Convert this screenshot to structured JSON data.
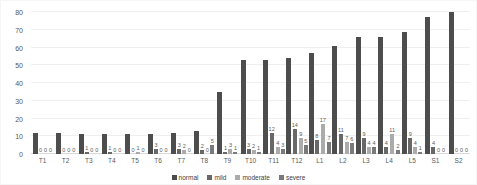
{
  "chart_data": {
    "type": "bar",
    "title": "",
    "xlabel": "",
    "ylabel": "",
    "ylim": [
      0,
      80
    ],
    "yticks": [
      0,
      10,
      20,
      30,
      40,
      50,
      60,
      70,
      80
    ],
    "grid": true,
    "legend_position": "bottom",
    "categories": [
      "T1",
      "T2",
      "T3",
      "T4",
      "T5",
      "T6",
      "T7",
      "T8",
      "T9",
      "T10",
      "T11",
      "T12",
      "L1",
      "L2",
      "L3",
      "L4",
      "L5",
      "S1",
      "S2"
    ],
    "series": [
      {
        "name": "normal",
        "color": "#4d4d4d",
        "show_value_labels": false,
        "values": [
          12,
          12,
          11,
          11,
          11,
          11,
          12,
          13,
          35,
          53,
          53,
          54,
          57,
          61,
          66,
          66,
          69,
          77,
          80
        ]
      },
      {
        "name": "mild",
        "color": "#686868",
        "show_value_labels": true,
        "values": [
          0,
          0,
          1,
          1,
          0,
          3,
          3,
          2,
          1,
          3,
          12,
          14,
          8,
          11,
          9,
          4,
          9,
          4,
          0
        ]
      },
      {
        "name": "moderate",
        "color": "#ababab",
        "show_value_labels": true,
        "values": [
          0,
          0,
          0,
          0,
          1,
          0,
          2,
          0,
          3,
          2,
          4,
          9,
          17,
          7,
          4,
          11,
          4,
          0,
          0
        ]
      },
      {
        "name": "severe",
        "color": "#7a7a7a",
        "show_value_labels": true,
        "values": [
          0,
          0,
          0,
          0,
          0,
          0,
          0,
          5,
          1,
          1,
          3,
          5,
          7,
          6,
          4,
          2,
          1,
          0,
          0
        ]
      }
    ],
    "colors": {
      "gridline": "#efefef",
      "axis_line": "#d9d9d9",
      "tick_text": "#595959",
      "value_label_text": "#595959",
      "legend_text": "#404040",
      "background": "#ffffff"
    }
  }
}
